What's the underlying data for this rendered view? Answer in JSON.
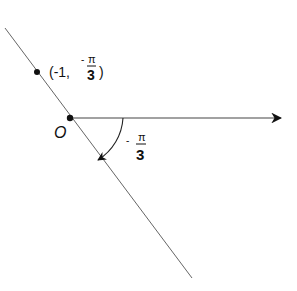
{
  "diagram": {
    "type": "polar-coordinate-plot",
    "origin_label": "O",
    "point_label": {
      "open": "(-1,",
      "sign": "-",
      "numerator": "π",
      "denominator": "3",
      "close": ")"
    },
    "angle_label": {
      "sign": "-",
      "numerator": "π",
      "denominator": "3"
    },
    "colors": {
      "line": "#555555",
      "ink": "#111111",
      "background": "#ffffff"
    }
  }
}
